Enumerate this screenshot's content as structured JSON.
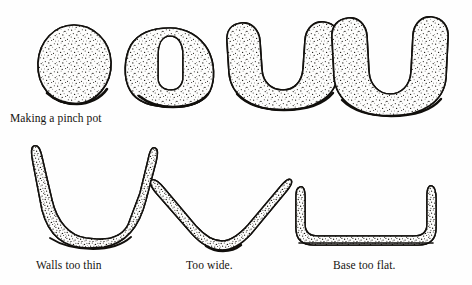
{
  "figure": {
    "title": "Making a pinch pot",
    "background_color": "#fefefe",
    "ink_color": "#12100d",
    "stipple_color": "#1a1712",
    "width": 472,
    "height": 285,
    "medium": "pen-and-ink line drawing with stipple shading",
    "rows": [
      {
        "name": "pinch-pot-sequence",
        "caption": "Making a pinch pot",
        "steps": [
          {
            "index": 1,
            "name": "ball-of-clay",
            "description": "round ball of clay, stippled, solid"
          },
          {
            "index": 2,
            "name": "thumb-indentation",
            "description": "ball with narrow deep thumb hole pressed into top"
          },
          {
            "index": 3,
            "name": "opened-walls",
            "description": "thick-walled U-shaped cross section, opening widened"
          },
          {
            "index": 4,
            "name": "finished-pot",
            "description": "taller thinner-walled U-shaped pot cross section"
          }
        ]
      },
      {
        "name": "common-faults",
        "examples": [
          {
            "index": 1,
            "name": "walls-too-thin",
            "caption": "Walls too thin",
            "description": "cross section with very thin tapering walls and a thick heavy base"
          },
          {
            "index": 2,
            "name": "too-wide",
            "caption": "Too wide.",
            "description": "shallow wide V-shaped cross section flaring outward"
          },
          {
            "index": 3,
            "name": "base-too-flat",
            "caption": "Base too flat.",
            "description": "cross section with a long flat base and sharp corners at the wall junction"
          }
        ]
      }
    ],
    "captions": {
      "pinch_pot": "Making a pinch pot",
      "walls_too_thin": "Walls too thin",
      "too_wide": "Too wide.",
      "base_too_flat": "Base too flat."
    }
  }
}
